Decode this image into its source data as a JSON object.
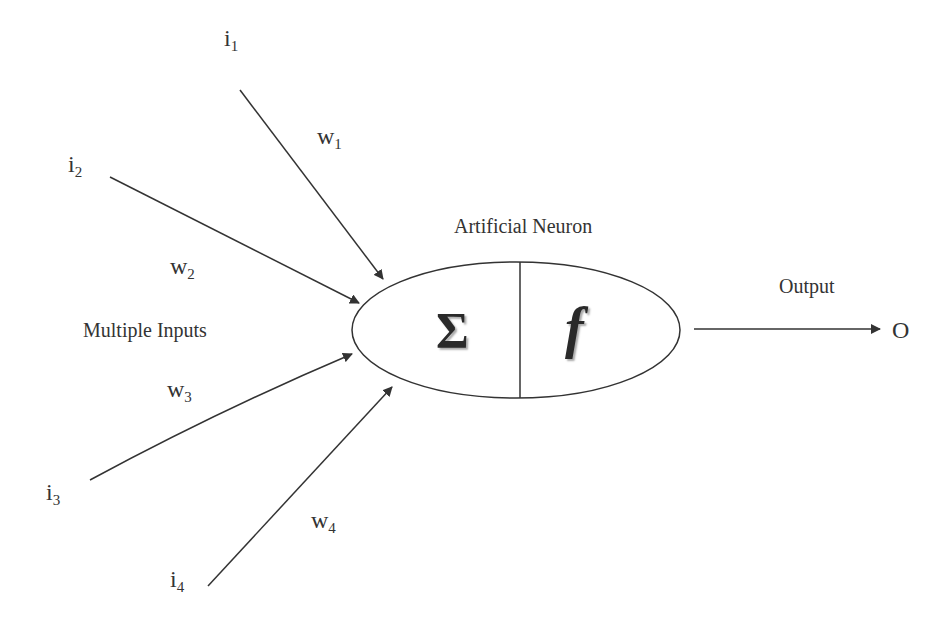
{
  "diagram": {
    "title": "Artificial Neuron",
    "inputs_label": "Multiple Inputs",
    "output_label": "Output",
    "output_symbol": "O",
    "summation_symbol": "Σ",
    "activation_symbol": "f",
    "inputs": [
      {
        "name": "i",
        "sub": "1",
        "weight": "w",
        "weight_sub": "1"
      },
      {
        "name": "i",
        "sub": "2",
        "weight": "w",
        "weight_sub": "2"
      },
      {
        "name": "i",
        "sub": "3",
        "weight": "w",
        "weight_sub": "3"
      },
      {
        "name": "i",
        "sub": "4",
        "weight": "w",
        "weight_sub": "4"
      }
    ],
    "colors": {
      "stroke": "#333333",
      "background": "#ffffff"
    }
  }
}
